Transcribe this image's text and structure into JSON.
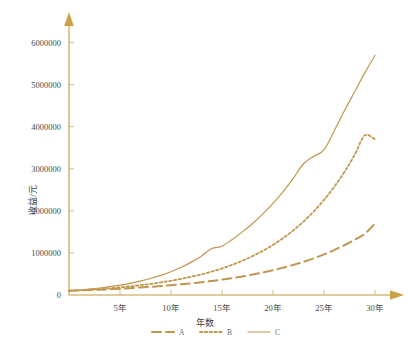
{
  "chart_data": {
    "type": "line",
    "title": "",
    "xlabel": "年数",
    "ylabel": "收益/元",
    "xlim": [
      0,
      30
    ],
    "ylim": [
      0,
      6300000
    ],
    "grid": false,
    "legend_position": "bottom",
    "x": [
      0,
      1,
      2,
      3,
      4,
      5,
      6,
      7,
      8,
      9,
      10,
      11,
      12,
      13,
      14,
      15,
      16,
      17,
      18,
      19,
      20,
      21,
      22,
      23,
      24,
      25,
      26,
      27,
      28,
      29,
      30
    ],
    "xtick_labels": [
      "5年",
      "10年",
      "15年",
      "20年",
      "25年",
      "30年"
    ],
    "xtick_values": [
      5,
      10,
      15,
      20,
      25,
      30
    ],
    "ytick_labels": [
      "0",
      "1000000",
      "2000000",
      "3000000",
      "4000000",
      "5000000",
      "6000000"
    ],
    "ytick_values": [
      0,
      1000000,
      2000000,
      3000000,
      4000000,
      5000000,
      6000000
    ],
    "series": [
      {
        "name": "A",
        "style": "dashed",
        "color": "#C0974E",
        "values": [
          100000,
          108000,
          117000,
          127000,
          138000,
          150000,
          163000,
          178000,
          194000,
          212000,
          232000,
          254000,
          278000,
          305000,
          334000,
          366000,
          402000,
          442000,
          486000,
          535000,
          589000,
          649000,
          716000,
          790000,
          873000,
          965000,
          1068000,
          1183000,
          1311000,
          1455000,
          1700000
        ]
      },
      {
        "name": "B",
        "style": "dotted",
        "color": "#C0974E",
        "values": [
          100000,
          112000,
          126000,
          142000,
          160000,
          181000,
          205000,
          232000,
          263000,
          298000,
          338000,
          383000,
          434000,
          492000,
          558000,
          633000,
          718000,
          815000,
          925000,
          1050000,
          1192000,
          1354000,
          1538000,
          1748000,
          1987000,
          2260000,
          2571000,
          2926000,
          3331000,
          3795000,
          3700000
        ]
      },
      {
        "name": "C",
        "style": "solid",
        "color": "#C0974E",
        "values": [
          100000,
          118000,
          140000,
          166000,
          197000,
          234000,
          278000,
          330000,
          392000,
          466000,
          554000,
          658000,
          782000,
          930000,
          1106000,
          1160000,
          1320000,
          1500000,
          1700000,
          1930000,
          2180000,
          2460000,
          2780000,
          3120000,
          3300000,
          3450000,
          3900000,
          4380000,
          4830000,
          5280000,
          5700000
        ]
      }
    ]
  },
  "axes": {
    "y_title": "收益/元",
    "x_title": "年数"
  },
  "legend": {
    "items": [
      {
        "label": "A",
        "style": "dashed"
      },
      {
        "label": "B",
        "style": "dotted"
      },
      {
        "label": "C",
        "style": "solid"
      }
    ]
  },
  "caption": {
    "text": ""
  },
  "colors": {
    "line": "#C0974E",
    "axis": "#D6BA7E",
    "tick_text": "#4a4a4a",
    "background": "#ffffff"
  }
}
